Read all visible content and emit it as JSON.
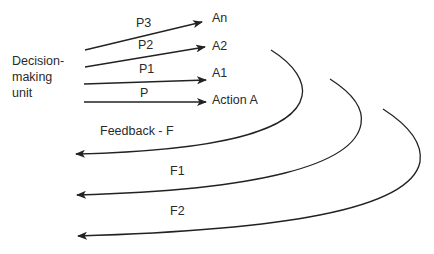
{
  "diagram": {
    "source_node": {
      "lines": [
        "Decision-",
        "making",
        "unit"
      ]
    },
    "actions": [
      {
        "path_label": "P3",
        "target_label": "An"
      },
      {
        "path_label": "P2",
        "target_label": "A2"
      },
      {
        "path_label": "P1",
        "target_label": "A1"
      },
      {
        "path_label": "P",
        "target_label": "Action A"
      }
    ],
    "feedback": [
      {
        "label": "Feedback - F"
      },
      {
        "label": "F1"
      },
      {
        "label": "F2"
      }
    ],
    "colors": {
      "stroke": "#222222",
      "text": "#2a2a2a",
      "background": "#ffffff"
    }
  }
}
